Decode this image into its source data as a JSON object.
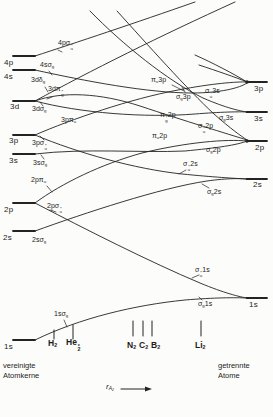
{
  "diagram": {
    "united_levels": [
      "4p",
      "4s",
      "3d",
      "3p",
      "3s",
      "2p",
      "2s",
      "1s"
    ],
    "separated_levels": [
      "3p",
      "3s",
      "2p",
      "2s",
      "1s"
    ],
    "orbital_labels_left": [
      "4pσ%{u|*}",
      "4sσ_{g}",
      "3dδ_{g}",
      "3dπ%{g|*}",
      "3dσ_{g}",
      "3pπ_{u}",
      "3pσ%{u|*}",
      "3sσ_{g}",
      "2pπ_{u}",
      "2pσ%{u|*}",
      "2sσ_{g}",
      "1sσ_{g}"
    ],
    "orbital_labels_right": [
      "π_{u}3p",
      "σ%{u|*}3s",
      "σ_{g}3p",
      "σ_{g}3s",
      "π%{g|*}2p",
      "σ%{u|*}2p",
      "π_{u}2p",
      "σ_{g}2p",
      "σ%{u|*}2s",
      "σ_{g}2s",
      "σ%{u|*}1s",
      "σ_{g}1s"
    ],
    "molecules": [
      "H_{2}",
      "He%{2|*}",
      "N_{2}",
      "C_{2}",
      "B_{2}",
      "Li_{2}"
    ],
    "caption_left": "vereinigte\nAtomkerne",
    "caption_right": "getrennte\nAtome",
    "x_axis_label": "r_{A₂}",
    "ink_color": "#1c1c1c"
  }
}
